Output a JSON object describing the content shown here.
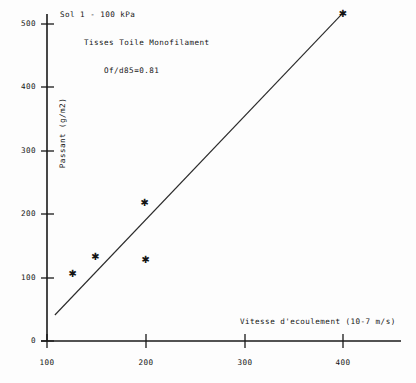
{
  "chart_data": {
    "type": "scatter",
    "title": "",
    "xlabel": "Vitesse d'ecoulement (10-7 m/s)",
    "ylabel": "Passant (g/m2)",
    "xlim": [
      47,
      458
    ],
    "ylim": [
      0,
      540
    ],
    "grid": false,
    "legend": null,
    "xticks": [
      100,
      200,
      300,
      400
    ],
    "yticks": [
      0,
      100,
      200,
      300,
      400,
      500
    ],
    "xtick_labels": [
      "100",
      "200",
      "300",
      "400"
    ],
    "ytick_labels": [
      "0",
      "100",
      "200",
      "300",
      "400",
      "500"
    ],
    "marker": "asterisk",
    "points": [
      {
        "x": 126,
        "y": 107
      },
      {
        "x": 149,
        "y": 134
      },
      {
        "x": 200,
        "y": 128
      },
      {
        "x": 199,
        "y": 218
      },
      {
        "x": 400,
        "y": 517
      }
    ],
    "series": [
      {
        "name": "Sol 1 - 100 kPa",
        "x": [
          126,
          149,
          200,
          199,
          400
        ],
        "values": [
          107,
          134,
          128,
          218,
          517
        ]
      }
    ],
    "trendline": {
      "type": "line",
      "x": [
        108,
        401
      ],
      "y": [
        41,
        519
      ]
    },
    "annotations": [
      {
        "id": "title",
        "text": "Sol 1 - 100 kPa"
      },
      {
        "id": "fabric",
        "text": "Tisses Toile Monofilament"
      },
      {
        "id": "ratio",
        "text": "Of/d85=0.81"
      }
    ],
    "colors": {
      "axis": "#1a1a1a",
      "marker": "#1a1a1a",
      "line": "#2b2b2b",
      "background": "#fdfdfd"
    }
  },
  "annotations": {
    "title": "Sol 1 - 100 kPa",
    "fabric": "Tisses Toile Monofilament",
    "ratio": "Of/d85=0.81"
  },
  "axes": {
    "x_label": "Vitesse d'ecoulement (10-7 m/s)",
    "y_label": "Passant (g/m2)",
    "x_ticks": [
      "100",
      "200",
      "300",
      "400"
    ],
    "y_ticks": [
      "500",
      "400",
      "300",
      "200",
      "100",
      "0"
    ]
  }
}
